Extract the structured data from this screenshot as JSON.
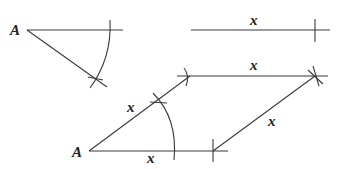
{
  "diagram": {
    "colors": {
      "stroke": "#3a3a3a",
      "text": "#222222",
      "background": "#ffffff"
    },
    "step1": {
      "vertex_label": "A",
      "description": "Angle at A with arc marking"
    },
    "step2": {
      "segment_label": "x",
      "description": "Given length x"
    },
    "step3": {
      "vertex_label": "A",
      "side_labels": {
        "top": "x",
        "left": "x",
        "right": "x",
        "bottom": "x"
      },
      "description": "Completed rhombus with all sides x"
    }
  }
}
